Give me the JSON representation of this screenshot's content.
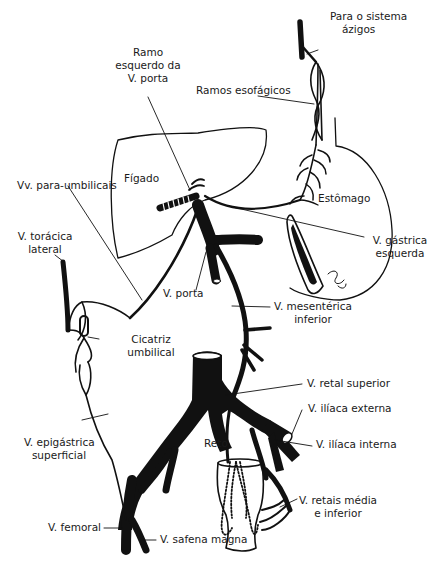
{
  "diagram": {
    "type": "anatomical-illustration",
    "colors": {
      "ink": "#111111",
      "background": "#ffffff",
      "text": "#1a1a1a"
    },
    "organs": {
      "liver": "Fígado",
      "stomach": "Estômago",
      "rectum": "Reto"
    },
    "labels": {
      "azygos_line1": "Para o sistema",
      "azygos_line2": "ázigos",
      "esophageal": "Ramos esofágicos",
      "left_portal_line1": "Ramo",
      "left_portal_line2": "esquerdo da",
      "left_portal_line3": "V. porta",
      "paraumbilical": "Vv. para-umbilicais",
      "lateral_thoracic_line1": "V. torácica",
      "lateral_thoracic_line2": "lateral",
      "left_gastric_line1": "V. gástrica",
      "left_gastric_line2": "esquerda",
      "portal_vein": "V. porta",
      "inferior_mesenteric_line1": "V. mesentérica",
      "inferior_mesenteric_line2": "inferior",
      "umbilical_scar_line1": "Cicatriz",
      "umbilical_scar_line2": "umbilical",
      "superior_rectal": "V. retal superior",
      "external_iliac": "V. ilíaca externa",
      "internal_iliac": "V. ilíaca interna",
      "superficial_epigastric_line1": "V. epigástrica",
      "superficial_epigastric_line2": "superficial",
      "middle_inferior_rectal_line1": "V. retais média",
      "middle_inferior_rectal_line2": "e inferior",
      "femoral": "V. femoral",
      "great_saphenous": "V. safena magna"
    }
  }
}
